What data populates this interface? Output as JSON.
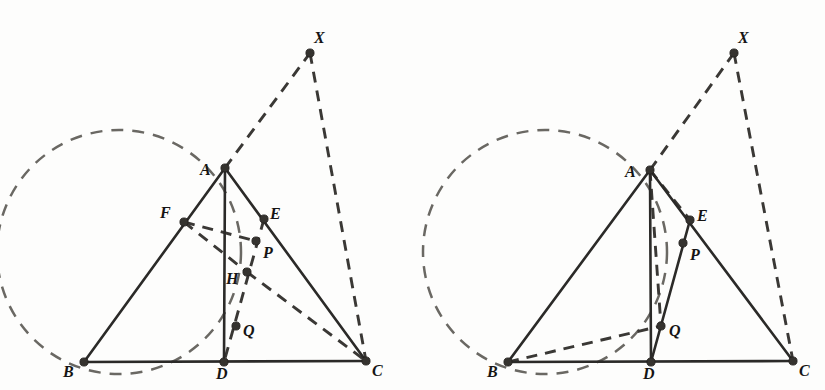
{
  "figure": {
    "width": 825,
    "height": 390,
    "background_color": "#fdfdfc",
    "line_color": "#2b2a28",
    "dash_color": "#3a3835",
    "circle_color": "#6a6863",
    "dot_color": "#35332f"
  },
  "panels": [
    {
      "id": "left-panel",
      "name": "left-figure",
      "points": [
        {
          "key": "A",
          "label": "A",
          "x": 225,
          "y": 168,
          "lx": 200,
          "ly": 162,
          "dot": true
        },
        {
          "key": "B",
          "label": "B",
          "x": 84,
          "y": 362,
          "lx": 63,
          "ly": 364,
          "dot": true
        },
        {
          "key": "C",
          "label": "C",
          "x": 366,
          "y": 361,
          "lx": 372,
          "ly": 363,
          "dot": true
        },
        {
          "key": "D",
          "label": "D",
          "x": 224,
          "y": 362,
          "lx": 216,
          "ly": 366,
          "dot": true
        },
        {
          "key": "E",
          "label": "E",
          "x": 264,
          "y": 219,
          "lx": 270,
          "ly": 206,
          "dot": true
        },
        {
          "key": "F",
          "label": "F",
          "x": 184,
          "y": 222,
          "lx": 160,
          "ly": 205,
          "dot": true
        },
        {
          "key": "H",
          "label": "H",
          "x": 247,
          "y": 272,
          "lx": 226,
          "ly": 271,
          "dot": true
        },
        {
          "key": "P",
          "label": "P",
          "x": 256,
          "y": 241,
          "lx": 263,
          "ly": 245,
          "dot": true
        },
        {
          "key": "Q",
          "label": "Q",
          "x": 236,
          "y": 326,
          "lx": 243,
          "ly": 323,
          "dot": true
        },
        {
          "key": "X",
          "label": "X",
          "x": 310,
          "y": 53,
          "lx": 314,
          "ly": 30,
          "dot": true
        }
      ],
      "circle": {
        "cx": 119,
        "cy": 252,
        "r": 122
      },
      "solid_edges": [
        {
          "from": "A",
          "to": "B",
          "name": "side-ab"
        },
        {
          "from": "B",
          "to": "C",
          "name": "side-bc"
        },
        {
          "from": "A",
          "to": "C",
          "name": "side-ac"
        },
        {
          "from": "A",
          "to": "D",
          "name": "cevian-ad"
        }
      ],
      "dashed_edges": [
        {
          "from": "A",
          "to": "X",
          "name": "ray-ax"
        },
        {
          "from": "X",
          "to": "C",
          "name": "segment-xc"
        },
        {
          "from": "F",
          "to": "P",
          "name": "segment-fp"
        },
        {
          "from": "F",
          "to": "H",
          "name": "segment-fh"
        },
        {
          "from": "H",
          "to": "C",
          "name": "segment-hc"
        },
        {
          "from": "E",
          "to": "D",
          "name": "segment-ed"
        }
      ]
    },
    {
      "id": "right-panel",
      "name": "right-figure",
      "points": [
        {
          "key": "A",
          "label": "A",
          "x": 650,
          "y": 170,
          "lx": 625,
          "ly": 164,
          "dot": true
        },
        {
          "key": "B",
          "label": "B",
          "x": 508,
          "y": 362,
          "lx": 487,
          "ly": 364,
          "dot": true
        },
        {
          "key": "C",
          "label": "C",
          "x": 793,
          "y": 361,
          "lx": 799,
          "ly": 363,
          "dot": true
        },
        {
          "key": "D",
          "label": "D",
          "x": 651,
          "y": 362,
          "lx": 643,
          "ly": 366,
          "dot": true
        },
        {
          "key": "E",
          "label": "E",
          "x": 690,
          "y": 220,
          "lx": 697,
          "ly": 208,
          "dot": true
        },
        {
          "key": "P",
          "label": "P",
          "x": 683,
          "y": 243,
          "lx": 690,
          "ly": 247,
          "dot": true
        },
        {
          "key": "Q",
          "label": "Q",
          "x": 661,
          "y": 326,
          "lx": 669,
          "ly": 323,
          "dot": true
        },
        {
          "key": "X",
          "label": "X",
          "x": 734,
          "y": 53,
          "lx": 738,
          "ly": 30,
          "dot": true
        }
      ],
      "circle": {
        "cx": 545,
        "cy": 252,
        "r": 122
      },
      "solid_edges": [
        {
          "from": "A",
          "to": "B",
          "name": "side-ab"
        },
        {
          "from": "B",
          "to": "C",
          "name": "side-bc"
        },
        {
          "from": "A",
          "to": "C",
          "name": "side-ac"
        },
        {
          "from": "A",
          "to": "D",
          "name": "cevian-ad"
        },
        {
          "from": "D",
          "to": "E",
          "name": "segment-de"
        }
      ],
      "dashed_edges": [
        {
          "from": "A",
          "to": "X",
          "name": "ray-ax"
        },
        {
          "from": "X",
          "to": "C",
          "name": "segment-xc"
        },
        {
          "from": "A",
          "to": "Q",
          "name": "segment-aq"
        },
        {
          "from": "B",
          "to": "Q",
          "name": "segment-bq"
        },
        {
          "from": "A",
          "to": "E",
          "name": "segment-ae"
        }
      ]
    }
  ]
}
